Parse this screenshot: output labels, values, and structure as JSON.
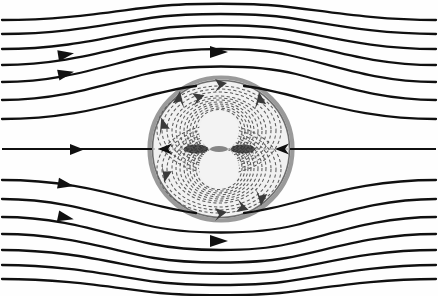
{
  "figure": {
    "caption": "",
    "background_color": "#fefefe",
    "width": 438,
    "height": 296
  },
  "chart_data": {
    "type": "line",
    "subtitle": "",
    "xlabel": "",
    "ylabel": "",
    "xlim": [
      0,
      438
    ],
    "ylim": [
      0,
      296
    ],
    "grid": false,
    "legend_position": "none",
    "annotations": [],
    "sphere": {
      "label": "sphere boundary",
      "center_x": 221,
      "center_y": 149,
      "radius": 73,
      "ring_color": "#9a9a9a",
      "ring_width": 4.2,
      "fill_color": "#f1f1f1"
    },
    "vortex_cores": [
      {
        "label": "upper vortex core",
        "center_x": 219,
        "center_y": 131,
        "radius": 20
      },
      {
        "label": "lower vortex core",
        "center_x": 219,
        "center_y": 168,
        "radius": 20
      }
    ],
    "axis_line": {
      "label": "symmetry axis",
      "y": 149,
      "x_start": 0,
      "x_end": 438,
      "stroke_color": "#101010",
      "stroke_width": 2.1
    },
    "series": [
      {
        "name": "external streamline 1",
        "y_far": 16,
        "y_mid": 4,
        "deflection": -12,
        "arrow": false,
        "arrow_x": 0
      },
      {
        "name": "external streamline 2",
        "y_far": 30,
        "y_mid": 16,
        "deflection": -14,
        "arrow": false,
        "arrow_x": 0
      },
      {
        "name": "external streamline 3",
        "y_far": 45,
        "y_mid": 27,
        "deflection": -18,
        "arrow": true,
        "arrow_x": 221
      },
      {
        "name": "external streamline 4",
        "y_far": 61,
        "y_mid": 38,
        "deflection": -23,
        "arrow": true,
        "arrow_x": 68
      },
      {
        "name": "external streamline 5",
        "y_far": 78,
        "y_mid": 52,
        "deflection": -26,
        "arrow": true,
        "arrow_x": 221
      },
      {
        "name": "external streamline 6",
        "y_far": 96,
        "y_mid": 70,
        "deflection": -26,
        "arrow": true,
        "arrow_x": 62
      },
      {
        "name": "external streamline 7",
        "y_far": 115,
        "y_mid": 95,
        "deflection": -20,
        "arrow": false,
        "arrow_x": 0
      },
      {
        "name": "axis streamline",
        "y_far": 149,
        "y_mid": 149,
        "deflection": 0,
        "arrow": true,
        "arrow_x": 78
      },
      {
        "name": "external streamline 8",
        "y_far": 183,
        "y_mid": 203,
        "deflection": 20,
        "arrow": true,
        "arrow_x": 62
      },
      {
        "name": "external streamline 9",
        "y_far": 202,
        "y_mid": 228,
        "deflection": 26,
        "arrow": true,
        "arrow_x": 221
      },
      {
        "name": "external streamline 10",
        "y_far": 220,
        "y_mid": 246,
        "deflection": 26,
        "arrow": true,
        "arrow_x": 62
      },
      {
        "name": "external streamline 11",
        "y_far": 237,
        "y_mid": 260,
        "deflection": 23,
        "arrow": false,
        "arrow_x": 0
      },
      {
        "name": "external streamline 12",
        "y_far": 253,
        "y_mid": 271,
        "deflection": 18,
        "arrow": false,
        "arrow_x": 0
      },
      {
        "name": "external streamline 13",
        "y_far": 268,
        "y_mid": 282,
        "deflection": 14,
        "arrow": false,
        "arrow_x": 0
      }
    ],
    "internal_streamlines": {
      "label": "internal recirculating streamlines (dashed)",
      "count_per_lobe": 11,
      "style": "dashed",
      "color": "#5a5a5a",
      "rotation_upper": "counter-clockwise-viewed",
      "rotation_lower": "clockwise-viewed"
    },
    "arrow_markers": [
      {
        "name": "inflow-arrow-axis",
        "x": 78,
        "y": 149,
        "direction": "right"
      },
      {
        "name": "inflow-arrow-upper-1",
        "x": 68,
        "y": 56,
        "direction": "right"
      },
      {
        "name": "inflow-arrow-upper-2",
        "x": 62,
        "y": 88,
        "direction": "right"
      },
      {
        "name": "inflow-arrow-lower-1",
        "x": 62,
        "y": 181,
        "direction": "right"
      },
      {
        "name": "inflow-arrow-lower-2",
        "x": 62,
        "y": 215,
        "direction": "right"
      },
      {
        "name": "top-bypass-arrow",
        "x": 221,
        "y": 52,
        "direction": "right"
      },
      {
        "name": "bottom-bypass-arrow",
        "x": 221,
        "y": 241,
        "direction": "right"
      },
      {
        "name": "sphere-inner-left-arrow",
        "x": 163,
        "y": 149,
        "direction": "left"
      },
      {
        "name": "sphere-inner-right-arrow",
        "x": 281,
        "y": 149,
        "direction": "left"
      },
      {
        "name": "vortex-arrow-top-left",
        "x": 181,
        "y": 97,
        "direction": "up-right"
      },
      {
        "name": "vortex-arrow-top-right",
        "x": 258,
        "y": 99,
        "direction": "down-right"
      },
      {
        "name": "vortex-arrow-mid-left",
        "x": 166,
        "y": 123,
        "direction": "down-left"
      },
      {
        "name": "vortex-arrow-mid-left-2",
        "x": 169,
        "y": 176,
        "direction": "up-left"
      },
      {
        "name": "vortex-arrow-bot-right",
        "x": 258,
        "y": 199,
        "direction": "up-right"
      },
      {
        "name": "vortex-arrow-bot-center",
        "x": 221,
        "y": 213,
        "direction": "right"
      },
      {
        "name": "vortex-arrow-top-center",
        "x": 221,
        "y": 86,
        "direction": "right"
      }
    ]
  }
}
